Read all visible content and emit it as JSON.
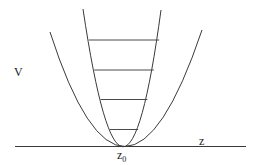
{
  "diagram": {
    "labels": {
      "y_axis": "V",
      "x_axis": "z",
      "minimum": "z",
      "minimum_subscript": "0"
    },
    "curves": [
      {
        "name": "narrow-potential",
        "type": "parabola",
        "relative_width": "narrow"
      },
      {
        "name": "wide-potential",
        "type": "parabola",
        "relative_width": "wide"
      }
    ],
    "energy_levels_count": 4,
    "colors": {
      "line": "#3a3a3a",
      "text": "#222222",
      "background": "#ffffff"
    }
  }
}
